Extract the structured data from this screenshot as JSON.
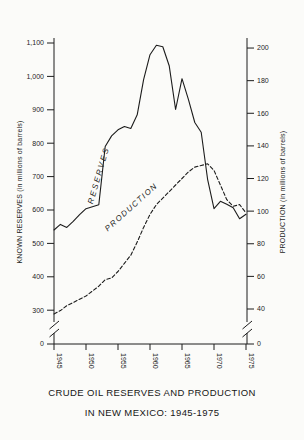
{
  "figure": {
    "title_line1": "CRUDE OIL RESERVES AND PRODUCTION",
    "title_line2": "IN NEW MEXICO: 1945-1975"
  },
  "chart_data": {
    "type": "line",
    "title": "CRUDE OIL RESERVES AND PRODUCTION IN NEW MEXICO: 1945-1975",
    "x": [
      1945,
      1946,
      1947,
      1948,
      1949,
      1950,
      1951,
      1952,
      1953,
      1954,
      1955,
      1956,
      1957,
      1958,
      1959,
      1960,
      1961,
      1962,
      1963,
      1964,
      1965,
      1966,
      1967,
      1968,
      1969,
      1970,
      1971,
      1972,
      1973,
      1974,
      1975
    ],
    "series": [
      {
        "name": "RESERVES",
        "axis": "left",
        "style": "solid",
        "values": [
          540,
          557,
          548,
          566,
          586,
          604,
          610,
          616,
          790,
          822,
          840,
          850,
          844,
          885,
          990,
          1065,
          1093,
          1089,
          1032,
          901,
          993,
          931,
          862,
          833,
          692,
          604,
          626,
          617,
          607,
          574,
          587
        ]
      },
      {
        "name": "PRODUCTION",
        "axis": "right",
        "style": "dashed",
        "values": [
          37,
          39,
          42,
          44,
          46,
          48,
          51,
          54,
          58,
          59,
          63,
          68,
          73,
          81,
          90,
          98,
          104,
          108,
          112,
          116,
          120,
          124,
          127,
          128,
          129,
          125,
          116,
          107,
          103,
          104,
          99
        ]
      }
    ],
    "left_axis": {
      "label": "KNOWN RESERVES (in millions of barrels)",
      "zero_label": "0",
      "ticks": [
        300,
        400,
        500,
        600,
        700,
        800,
        900,
        1000,
        1100
      ],
      "tick_labels": [
        "300",
        "400",
        "500",
        "600",
        "700",
        "800",
        "900",
        "1,000",
        "1,100"
      ],
      "axis_break": true
    },
    "right_axis": {
      "label": "PRODUCTION (in millions of barrels)",
      "zero_label": "0",
      "ticks": [
        40,
        60,
        80,
        100,
        120,
        140,
        160,
        180,
        200
      ],
      "tick_labels": [
        "40",
        "60",
        "80",
        "100",
        "120",
        "140",
        "160",
        "180",
        "200"
      ],
      "axis_break": true
    },
    "x_axis": {
      "tick_years": [
        1945,
        1950,
        1955,
        1960,
        1965,
        1970,
        1975
      ],
      "tick_labels": [
        "1945",
        "1950",
        "1955",
        "1960",
        "1965",
        "1970",
        "1975"
      ]
    },
    "line_color": "#1c1c1c",
    "background": "#fbfbf9",
    "legend_position": "labels-on-curves",
    "grid": false
  }
}
